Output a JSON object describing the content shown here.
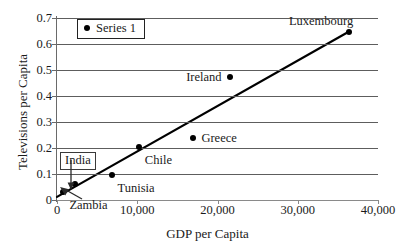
{
  "chart_data": {
    "type": "scatter",
    "title": "",
    "xlabel": "GDP per Capita",
    "ylabel": "Televisions per Capita",
    "xlim": [
      0,
      40000
    ],
    "ylim": [
      0,
      0.7
    ],
    "grid": true,
    "legend_position": "top-left",
    "legend": [
      "Series 1"
    ],
    "xticks": [
      "0",
      "10,000",
      "20,000",
      "30,000",
      "40,000"
    ],
    "xtick_values": [
      0,
      10000,
      20000,
      30000,
      40000
    ],
    "yticks": [
      "0",
      "0.1",
      "0.2",
      "0.3",
      "0.4",
      "0.5",
      "0.6",
      "0.7"
    ],
    "ytick_values": [
      0,
      0.1,
      0.2,
      0.3,
      0.4,
      0.5,
      0.6,
      0.7
    ],
    "points": [
      {
        "label": "Zambia",
        "x": 800,
        "y": 0.03,
        "label_pos": "below-right"
      },
      {
        "label": "India",
        "x": 2300,
        "y": 0.061,
        "label_pos": "callout-above"
      },
      {
        "label": "Tunisia",
        "x": 6800,
        "y": 0.097,
        "label_pos": "below-right"
      },
      {
        "label": "Chile",
        "x": 10200,
        "y": 0.202,
        "label_pos": "below-right"
      },
      {
        "label": "Greece",
        "x": 17000,
        "y": 0.238,
        "label_pos": "right"
      },
      {
        "label": "Ireland",
        "x": 21500,
        "y": 0.475,
        "label_pos": "left"
      },
      {
        "label": "Luxembourg",
        "x": 36400,
        "y": 0.648,
        "label_pos": "above-left"
      }
    ],
    "trendline": {
      "x_start": 0,
      "y_start": 0.012,
      "x_end": 36400,
      "y_end": 0.648
    }
  },
  "legend": {
    "series_label": "Series 1"
  },
  "axes": {
    "x_title": "GDP per Capita",
    "y_title": "Televisions per Capita"
  },
  "colors": {
    "marker": "#000000",
    "trendline": "#000000",
    "gridline": "#5d5d5d",
    "background": "#ffffff"
  }
}
